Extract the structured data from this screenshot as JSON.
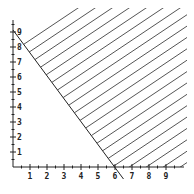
{
  "chart_data": {
    "type": "area",
    "title": "",
    "xlabel": "",
    "ylabel": "",
    "xlim": [
      0,
      10
    ],
    "ylim": [
      0,
      10
    ],
    "grid": false,
    "x_ticks": [
      1,
      2,
      3,
      4,
      5,
      6,
      7,
      8,
      9
    ],
    "y_ticks": [
      1,
      2,
      3,
      4,
      5,
      6,
      7,
      8,
      9
    ],
    "boundary_line": {
      "points": [
        [
          0,
          9
        ],
        [
          6,
          0
        ]
      ],
      "equation": "3x + 2y = 18",
      "extends_past": [
        6.5,
        -0.8
      ]
    },
    "shaded_region": {
      "description": "hatched region above/right of boundary line",
      "inequality": "3x + 2y >= 18",
      "style": "diagonal hatch"
    },
    "colors": {
      "axis": "#222222",
      "boundary": "#222222",
      "hatch": "#555555"
    }
  }
}
